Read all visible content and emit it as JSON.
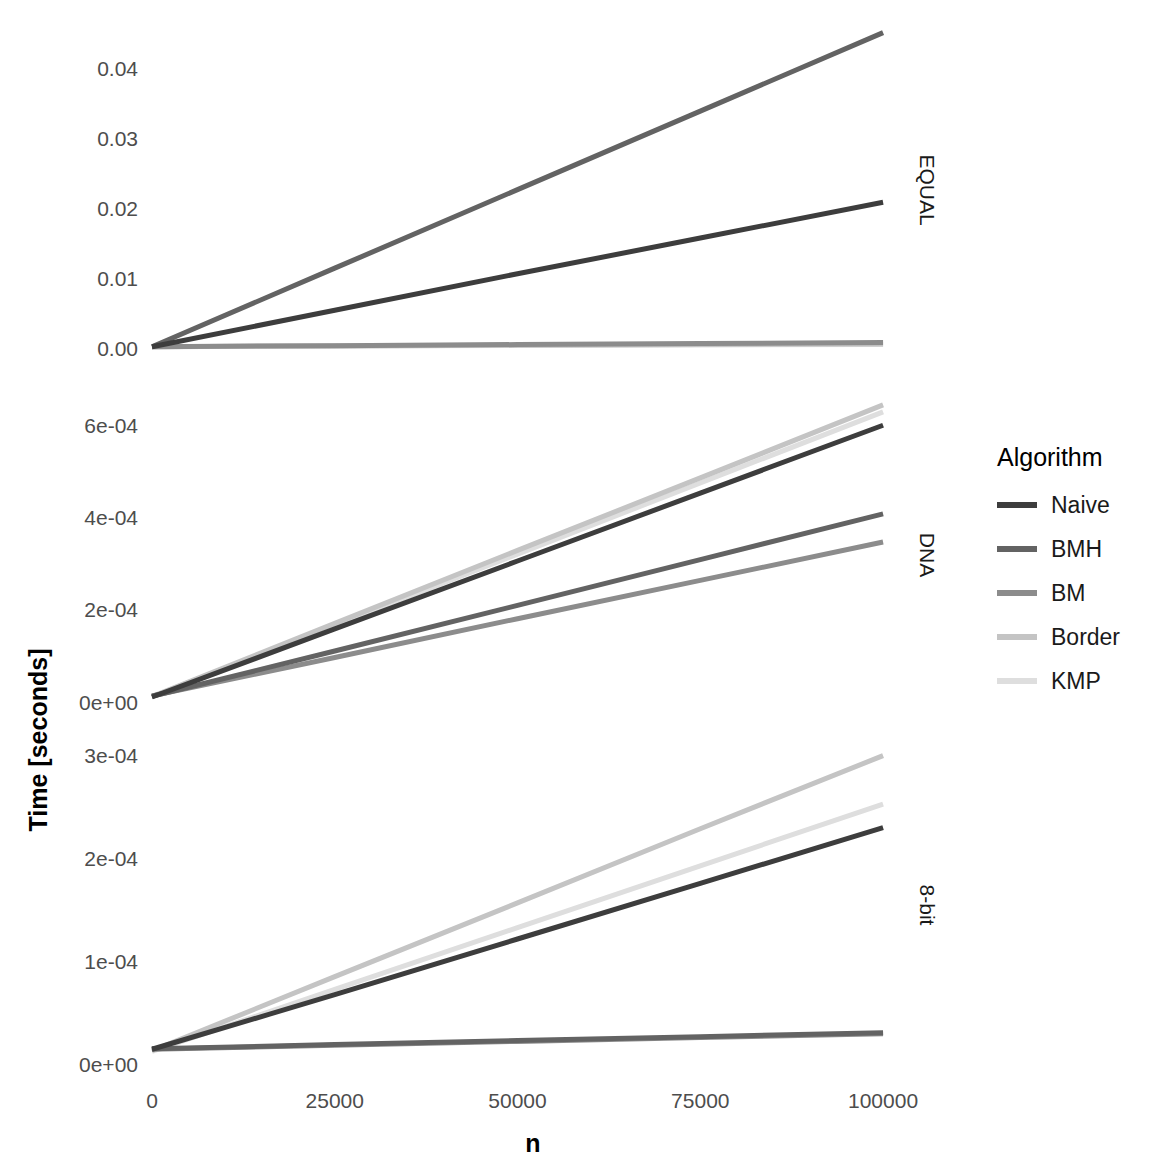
{
  "chart_data": {
    "type": "line",
    "title": "",
    "xlabel": "n",
    "ylabel": "Time [seconds]",
    "grid": false,
    "legend_position": "right",
    "legend_title": "Algorithm",
    "facet_direction": "vertical",
    "facet_strip_side": "right",
    "x": [
      0,
      25000,
      50000,
      75000,
      100000
    ],
    "xlim": [
      0,
      103000
    ],
    "xticks": [
      0,
      25000,
      50000,
      75000,
      100000
    ],
    "xticklabels": [
      "0",
      "25000",
      "50000",
      "75000",
      "100000"
    ],
    "series_names": [
      "Naive",
      "BMH",
      "BM",
      "Border",
      "KMP"
    ],
    "series_colors": [
      "#3d3d3d",
      "#636363",
      "#8c8c8c",
      "#c4c4c4",
      "#dedede"
    ],
    "panels": [
      {
        "name": "EQUAL",
        "strip_label": "EQUAL",
        "ylim": [
          -0.0015,
          0.047
        ],
        "yticks": [
          0.0,
          0.01,
          0.02,
          0.03,
          0.04
        ],
        "yticklabels": [
          "0.00",
          "0.01",
          "0.02",
          "0.03",
          "0.04"
        ],
        "series": [
          {
            "name": "Naive",
            "values": [
              0.0004,
              0.0056,
              0.0108,
              0.0159,
              0.021
            ]
          },
          {
            "name": "BMH",
            "values": [
              0.0004,
              0.0116,
              0.0228,
              0.034,
              0.0452
            ]
          },
          {
            "name": "BM",
            "values": [
              0.0004,
              0.00055,
              0.0007,
              0.00085,
              0.001
            ]
          },
          {
            "name": "Border",
            "values": [
              0.0004,
              0.0005,
              0.0006,
              0.0007,
              0.0008
            ]
          },
          {
            "name": "KMP",
            "values": [
              0.0004,
              0.00048,
              0.00056,
              0.00064,
              0.00072
            ]
          }
        ]
      },
      {
        "name": "DNA",
        "strip_label": "DNA",
        "ylim": [
          -2e-05,
          0.00066
        ],
        "yticks": [
          0.0,
          0.0002,
          0.0004,
          0.0006
        ],
        "yticklabels": [
          "0e+00",
          "2e-04",
          "4e-04",
          "6e-04"
        ],
        "series": [
          {
            "name": "Naive",
            "values": [
              1.25e-05,
              0.00016,
              0.000307,
              0.000454,
              0.000601
            ]
          },
          {
            "name": "BMH",
            "values": [
              1.4e-05,
              0.000112,
              0.000211,
              0.00031,
              0.000409
            ]
          },
          {
            "name": "BM",
            "values": [
              1.5e-05,
              9.8e-05,
              0.000182,
              0.000265,
              0.000348
            ]
          },
          {
            "name": "Border",
            "values": [
              1.35e-05,
              0.000172,
              0.00033,
              0.000487,
              0.000645
            ]
          },
          {
            "name": "KMP",
            "values": [
              1.3e-05,
              0.000168,
              0.000322,
              0.000476,
              0.00063
            ]
          }
        ]
      },
      {
        "name": "8-bit",
        "strip_label": "8-bit",
        "ylim": [
          -1e-05,
          0.00032
        ],
        "yticks": [
          0.0,
          0.0001,
          0.0002,
          0.0003
        ],
        "yticklabels": [
          "0e+00",
          "1e-04",
          "2e-04",
          "3e-04"
        ],
        "series": [
          {
            "name": "Naive",
            "values": [
              1.5e-05,
              6.8e-05,
              0.000122,
              0.000176,
              0.00023
            ]
          },
          {
            "name": "BMH",
            "values": [
              1.55e-05,
              1.95e-05,
              2.35e-05,
              2.72e-05,
              3.1e-05
            ]
          },
          {
            "name": "BM",
            "values": [
              1.5e-05,
              1.88e-05,
              2.26e-05,
              2.63e-05,
              3e-05
            ]
          },
          {
            "name": "Border",
            "values": [
              1.35e-05,
              8.55e-05,
              0.000157,
              0.000229,
              0.0003
            ]
          },
          {
            "name": "KMP",
            "values": [
              1.3e-05,
              7.3e-05,
              0.000133,
              0.000193,
              0.000253
            ]
          }
        ]
      }
    ]
  },
  "legend": {
    "title": "Algorithm",
    "items": [
      {
        "label": "Naive",
        "color": "#3d3d3d"
      },
      {
        "label": "BMH",
        "color": "#636363"
      },
      {
        "label": "BM",
        "color": "#8c8c8c"
      },
      {
        "label": "Border",
        "color": "#c4c4c4"
      },
      {
        "label": "KMP",
        "color": "#dedede"
      }
    ]
  },
  "axes": {
    "x_title": "n",
    "y_title": "Time [seconds]"
  }
}
